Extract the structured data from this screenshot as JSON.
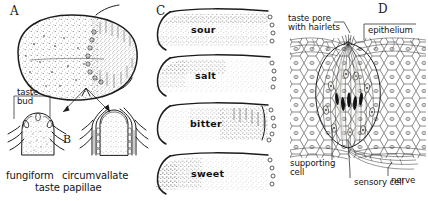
{
  "figure": {
    "background_color": "#ffffff",
    "ink_color": "#1b1b1b"
  },
  "panels": [
    {
      "id": "A",
      "letter": "A",
      "name": "tongue-dorsum-overview",
      "labels": [
        {
          "name": "taste-bud-label",
          "text": "taste\nbud"
        },
        {
          "name": "fungiform-label",
          "text": "fungiform"
        },
        {
          "name": "circumvallate-label",
          "text": "circumvallate"
        },
        {
          "name": "taste-papillae-label",
          "text": "taste papillae"
        }
      ]
    },
    {
      "id": "B",
      "letter": "B",
      "name": "papilla-cross-sections"
    },
    {
      "id": "C",
      "letter": "C",
      "name": "taste-region-maps",
      "maps": [
        {
          "name": "taste-map-sour",
          "label": "sour"
        },
        {
          "name": "taste-map-salt",
          "label": "salt"
        },
        {
          "name": "taste-map-bitter",
          "label": "bitter"
        },
        {
          "name": "taste-map-sweet",
          "label": "sweet"
        }
      ]
    },
    {
      "id": "D",
      "letter": "D",
      "name": "taste-bud-microanatomy",
      "labels": [
        {
          "name": "taste-pore-label",
          "text": "taste pore\nwith hairlets"
        },
        {
          "name": "epithelium-label",
          "text": "epithelium"
        },
        {
          "name": "supporting-cell-label",
          "text": "supporting\ncell"
        },
        {
          "name": "sensory-cell-label",
          "text": "sensory cell"
        },
        {
          "name": "nerve-label",
          "text": "nerve"
        }
      ]
    }
  ]
}
